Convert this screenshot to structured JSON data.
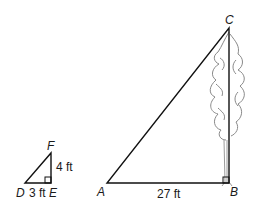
{
  "small_triangle": {
    "vertices": {
      "D": "D",
      "E": "E",
      "F": "F"
    },
    "sides": {
      "DE": "3 ft",
      "EF": "4 ft"
    },
    "right_angle_at": "E"
  },
  "large_triangle": {
    "vertices": {
      "A": "A",
      "B": "B",
      "C": "C"
    },
    "sides": {
      "AB": "27 ft"
    },
    "right_angle_at": "B"
  },
  "illustration": {
    "object": "tree",
    "height_side": "BC"
  },
  "colors": {
    "line": "#111111",
    "tree": "#8a8a8a",
    "background": "#ffffff"
  }
}
